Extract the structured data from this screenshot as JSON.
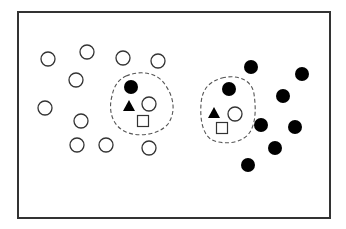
{
  "canvas": {
    "width": 346,
    "height": 229,
    "background": "#ffffff"
  },
  "colors": {
    "frame": "#333333",
    "stroke": "#333333",
    "fill_dark": "#000000",
    "fill_light": "#ffffff",
    "dashed_outline": "#555555"
  },
  "frame": {
    "x": 18,
    "y": 12,
    "width": 312,
    "height": 206,
    "stroke_width": 2
  },
  "marker_radius": 7,
  "open_circles": [
    {
      "cx": 48,
      "cy": 59
    },
    {
      "cx": 87,
      "cy": 52
    },
    {
      "cx": 123,
      "cy": 58
    },
    {
      "cx": 158,
      "cy": 61
    },
    {
      "cx": 76,
      "cy": 80
    },
    {
      "cx": 45,
      "cy": 108
    },
    {
      "cx": 81,
      "cy": 121
    },
    {
      "cx": 77,
      "cy": 145
    },
    {
      "cx": 106,
      "cy": 145
    },
    {
      "cx": 149,
      "cy": 148
    }
  ],
  "filled_circles": [
    {
      "cx": 251,
      "cy": 67
    },
    {
      "cx": 302,
      "cy": 74
    },
    {
      "cx": 283,
      "cy": 96
    },
    {
      "cx": 261,
      "cy": 125
    },
    {
      "cx": 295,
      "cy": 127
    },
    {
      "cx": 275,
      "cy": 148
    },
    {
      "cx": 248,
      "cy": 165
    }
  ],
  "clusters": [
    {
      "name": "left-cluster",
      "outline_path": "M 126 76 C 140 70, 158 72, 166 86 C 174 98, 176 112, 168 124 C 160 134, 140 138, 126 132 C 112 126, 108 110, 112 96 C 114 86, 118 80, 126 76 Z",
      "filled_circle": {
        "cx": 131,
        "cy": 87
      },
      "triangle": {
        "cx": 129,
        "cy": 106
      },
      "open_circle": {
        "cx": 149,
        "cy": 104
      },
      "square": {
        "cx": 143,
        "cy": 121
      }
    },
    {
      "name": "right-cluster",
      "outline_path": "M 222 78 C 238 74, 252 80, 254 94 C 256 108, 256 122, 250 132 C 244 142, 226 146, 212 140 C 202 134, 200 118, 201 104 C 202 90, 208 82, 222 78 Z",
      "filled_circle": {
        "cx": 229,
        "cy": 89
      },
      "triangle": {
        "cx": 214,
        "cy": 113
      },
      "open_circle": {
        "cx": 235,
        "cy": 114
      },
      "square": {
        "cx": 222,
        "cy": 128
      }
    }
  ]
}
